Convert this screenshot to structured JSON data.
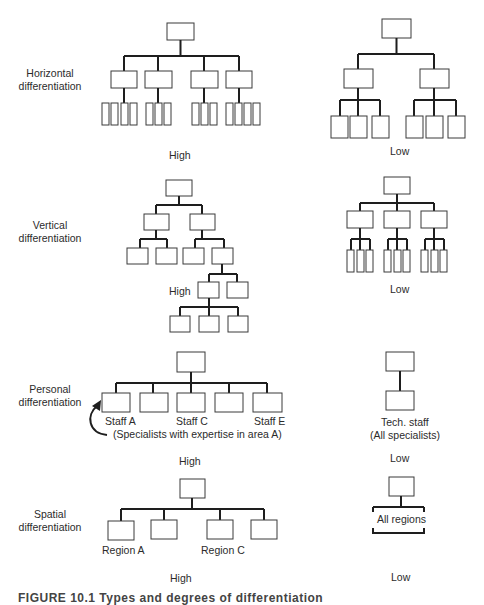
{
  "rows": [
    {
      "label_line1": "Horizontal",
      "label_line2": "differentiation",
      "high_label": "High",
      "low_label": "Low"
    },
    {
      "label_line1": "Vertical",
      "label_line2": "differentiation",
      "high_label": "High",
      "low_label": "Low"
    },
    {
      "label_line1": "Personal",
      "label_line2": "differentiation",
      "high_label": "High",
      "low_label": "Low",
      "high_nodes": [
        "Staff A",
        "Staff C",
        "Staff E"
      ],
      "high_note": "(Specialists with expertise in area A)",
      "low_node_line1": "Tech. staff",
      "low_node_line2": "(All specialists)"
    },
    {
      "label_line1": "Spatial",
      "label_line2": "differentiation",
      "high_label": "High",
      "low_label": "Low",
      "high_nodes": [
        "Region A",
        "Region C"
      ],
      "low_node": "All regions"
    }
  ],
  "caption": "FIGURE 10.1  Types and degrees of differentiation"
}
